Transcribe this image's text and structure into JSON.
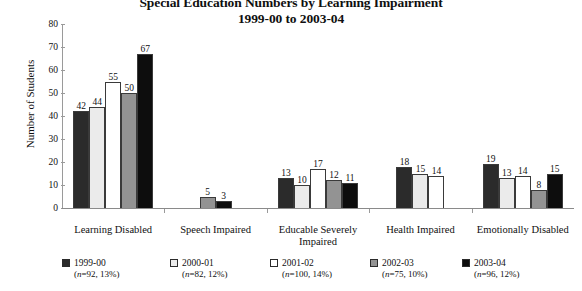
{
  "chart_data": {
    "type": "bar",
    "title": "Special Education Numbers by Learning Impairment",
    "subtitle": "1999-00 to 2003-04",
    "xlabel": "",
    "ylabel": "Number of Students",
    "ylim": [
      0,
      80
    ],
    "ytick_values": [
      0,
      10,
      20,
      30,
      40,
      50,
      60,
      70,
      80
    ],
    "grid": false,
    "legend_position": "bottom",
    "categories": [
      "Learning Disabled",
      "Speech Impaired",
      "Educable Severely Impaired",
      "Health Impaired",
      "Emotionally Disabled"
    ],
    "series": [
      {
        "name": "1999-00",
        "n": 92,
        "percent": "13%",
        "color": "#2b2b2b",
        "values": [
          42,
          null,
          13,
          18,
          19
        ]
      },
      {
        "name": "2000-01",
        "n": 82,
        "percent": "12%",
        "color": "#ebebeb",
        "values": [
          44,
          null,
          10,
          15,
          13
        ]
      },
      {
        "name": "2001-02",
        "n": 100,
        "percent": "14%",
        "color": "#ffffff",
        "values": [
          55,
          null,
          17,
          14,
          14
        ]
      },
      {
        "name": "2002-03",
        "n": 75,
        "percent": "10%",
        "color": "#939393",
        "values": [
          50,
          5,
          12,
          null,
          8
        ]
      },
      {
        "name": "2003-04",
        "n": 96,
        "percent": "12%",
        "color": "#0d0d0d",
        "values": [
          67,
          3,
          11,
          null,
          15
        ]
      }
    ]
  },
  "title": {
    "line1": "Special Education Numbers by Learning Impairment",
    "line2": "1999-00 to 2003-04"
  },
  "axes": {
    "y_title": "Number of Students",
    "y_ticks": [
      "80",
      "70",
      "60",
      "50",
      "40",
      "30",
      "20",
      "10",
      "0"
    ]
  },
  "categories": [
    {
      "label": "Learning Disabled"
    },
    {
      "label": "Speech Impaired"
    },
    {
      "label": "Educable Severely",
      "label2": "Impaired"
    },
    {
      "label": "Health Impaired"
    },
    {
      "label": "Emotionally Disabled"
    }
  ],
  "legend": [
    {
      "label": "1999-00",
      "sub_n": "(n=92, 13%)",
      "color": "#2b2b2b"
    },
    {
      "label": "2000-01",
      "sub_n": "(n=82, 12%)",
      "color": "#ebebeb"
    },
    {
      "label": "2001-02",
      "sub_n": "(n=100, 14%)",
      "color": "#ffffff"
    },
    {
      "label": "2002-03",
      "sub_n": "(n=75, 10%)",
      "color": "#939393"
    },
    {
      "label": "2003-04",
      "sub_n": "(n=96, 12%)",
      "color": "#0d0d0d"
    }
  ],
  "bar_labels": {
    "g0": [
      "42",
      "44",
      "55",
      "50",
      "67"
    ],
    "g1": [
      "5",
      "3"
    ],
    "g2": [
      "13",
      "10",
      "17",
      "12",
      "11"
    ],
    "g3": [
      "18",
      "15",
      "14"
    ],
    "g4": [
      "19",
      "13",
      "14",
      "8",
      "15"
    ]
  }
}
